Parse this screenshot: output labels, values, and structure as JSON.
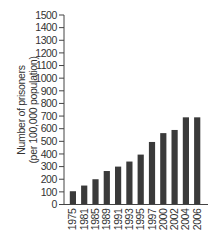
{
  "chart_data": {
    "type": "bar",
    "title": "",
    "xlabel": "",
    "ylabel": "Number of prisoners (per 100,000 population)",
    "ylabel_lines": [
      "Number of prisoners",
      "(per 100,000 population)"
    ],
    "categories": [
      "1975",
      "1981",
      "1985",
      "1989",
      "1991",
      "1993",
      "1995",
      "1997",
      "2000",
      "2002",
      "2004",
      "2006"
    ],
    "values": [
      105,
      150,
      200,
      265,
      300,
      340,
      395,
      495,
      565,
      590,
      690,
      690
    ],
    "ylim": [
      0,
      1500
    ],
    "yticks": [
      0,
      100,
      200,
      300,
      400,
      500,
      600,
      700,
      800,
      900,
      1000,
      1100,
      1200,
      1300,
      1400,
      1500
    ],
    "grid": false,
    "legend": null,
    "bar_color": "#3a3a3a",
    "axis_color": "#444444"
  }
}
